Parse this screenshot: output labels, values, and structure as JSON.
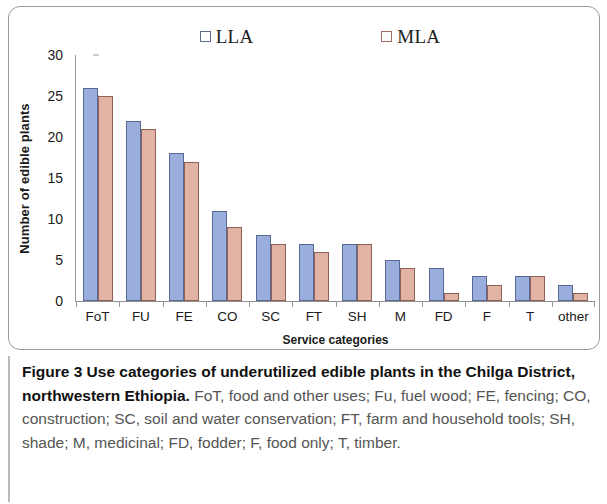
{
  "figure": {
    "label": "Figure 3",
    "title": "Use categories of underutilized edible plants in the Chilga District, northwestern Ethiopia.",
    "description": "FoT, food and other uses; Fu, fuel wood; FE, fencing; CO, construction; SC, soil and water conservation; FT, farm and household tools; SH, shade; M, medicinal; FD, fodder; F, food only; T, timber."
  },
  "legend": {
    "items": [
      {
        "label": "LLA",
        "color": "#9aaede"
      },
      {
        "label": "MLA",
        "color": "#e0b3a4"
      }
    ]
  },
  "axes": {
    "y_title": "Number of edible plants",
    "x_title": "Service categories",
    "y_ticks": [
      "0",
      "5",
      "10",
      "15",
      "20",
      "25",
      "30"
    ]
  },
  "chart_data": {
    "type": "bar",
    "title": "Use categories of underutilized edible plants in the Chilga District, northwestern Ethiopia",
    "xlabel": "Service categories",
    "ylabel": "Number of edible plants",
    "ylim": [
      0,
      30
    ],
    "yticks": [
      0,
      5,
      10,
      15,
      20,
      25,
      30
    ],
    "grid": false,
    "legend_position": "top-center",
    "categories": [
      "FoT",
      "FU",
      "FE",
      "CO",
      "SC",
      "FT",
      "SH",
      "M",
      "FD",
      "F",
      "T",
      "other"
    ],
    "series": [
      {
        "name": "LLA",
        "color": "#9aaede",
        "values": [
          26,
          22,
          18,
          11,
          8,
          7,
          7,
          5,
          4,
          3,
          3,
          2
        ]
      },
      {
        "name": "MLA",
        "color": "#e0b3a4",
        "values": [
          25,
          21,
          17,
          9,
          7,
          6,
          7,
          4,
          1,
          2,
          3,
          1
        ]
      }
    ]
  }
}
